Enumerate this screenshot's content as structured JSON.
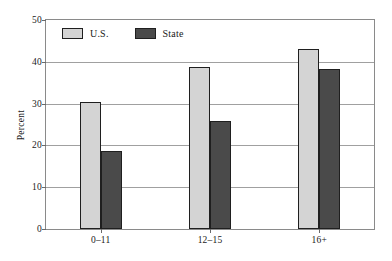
{
  "chart_data": {
    "type": "bar",
    "title": "",
    "subtitle": "",
    "xlabel": "",
    "ylabel": "Percent",
    "categories": [
      "0–11",
      "12–15",
      "16+"
    ],
    "series": [
      {
        "name": "U.S.",
        "values": [
          30.4,
          38.7,
          43.0
        ],
        "color": "#d4d4d4"
      },
      {
        "name": "State",
        "values": [
          18.7,
          25.8,
          38.2
        ],
        "color": "#4a4a4a"
      }
    ],
    "ylim": [
      0,
      50
    ],
    "yticks": [
      0,
      10,
      20,
      30,
      40,
      50
    ],
    "ytick_labels": [
      "0",
      "10",
      "20",
      "30",
      "40",
      "50"
    ],
    "grid": true,
    "grid_axis": "y",
    "legend_position": "top-left-inside",
    "legend": [
      {
        "label": "U.S.",
        "color": "#d4d4d4"
      },
      {
        "label": "State",
        "color": "#4a4a4a"
      }
    ],
    "bar_edge_color": "#1f1f1f",
    "frame_color": "#8a8a8a",
    "background": "#ffffff"
  }
}
